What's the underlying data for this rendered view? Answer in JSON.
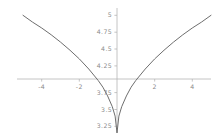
{
  "chart_data": {
    "type": "line",
    "title": "",
    "subtitle": "",
    "xlabel": "",
    "ylabel": "",
    "xlim": [
      -5,
      5
    ],
    "ylim": [
      3.25,
      5
    ],
    "grid": false,
    "legend": null,
    "axes_style": "centered-cross",
    "x_ticks": [
      -4,
      -2,
      2,
      4
    ],
    "x_tick_labels": [
      "-4",
      "-2",
      "2",
      "4"
    ],
    "y_ticks": [
      3.25,
      3.5,
      3.75,
      4.25,
      4.5,
      4.75,
      5
    ],
    "y_tick_labels": [
      "3.25",
      "3.5",
      "3.75",
      "4.25",
      "4.5",
      "4.75",
      "5"
    ],
    "series": [
      {
        "name": "curve",
        "color": "#6e6e6e",
        "x": [
          -5,
          -4.5,
          -4,
          -3.5,
          -3,
          -2.5,
          -2,
          -1.5,
          -1,
          -0.75,
          -0.5,
          -0.25,
          -0.1,
          0,
          0.1,
          0.25,
          0.5,
          0.75,
          1,
          1.5,
          2,
          2.5,
          3,
          3.5,
          4,
          4.5,
          5
        ],
        "y": [
          5.0,
          4.9,
          4.81,
          4.71,
          4.6,
          4.48,
          4.35,
          4.2,
          4.03,
          3.93,
          3.8,
          3.64,
          3.5,
          3.25,
          3.5,
          3.64,
          3.8,
          3.93,
          4.03,
          4.2,
          4.35,
          4.48,
          4.6,
          4.71,
          4.81,
          4.9,
          5.0
        ]
      }
    ],
    "annotations": []
  },
  "axes": {
    "x_axis_color": "#b5b5b5",
    "y_axis_color": "#b5b5b5",
    "label_color": "#8a8a8a"
  },
  "background": "#ffffff"
}
